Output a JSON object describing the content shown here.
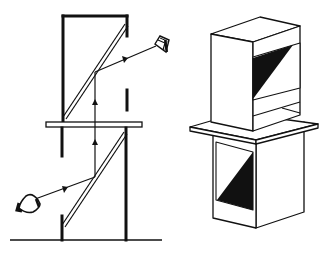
{
  "diagram": {
    "description": "Periscope mechanism: schematic cross-section (left) and isometric box view (right)",
    "colors": {
      "ink": "#111111",
      "paper": "#ffffff"
    },
    "left_schematic": {
      "label": "Cross-section schematic of two stacked periscopes with angled mirrors",
      "components": [
        "upper-housing",
        "upper-mirror",
        "separator-plate",
        "lower-housing",
        "lower-mirror",
        "ground-line",
        "light-ray",
        "eye-upper",
        "eye-lower"
      ],
      "ray_direction": "from lower eye into lower mirror, up through plate, into upper mirror, out to upper eye"
    },
    "right_isometric": {
      "label": "Isometric view of two boxes separated by a plate, each showing a diagonal mirror face",
      "components": [
        "upper-box",
        "upper-box-window",
        "plate",
        "lower-box",
        "lower-box-window"
      ]
    }
  }
}
